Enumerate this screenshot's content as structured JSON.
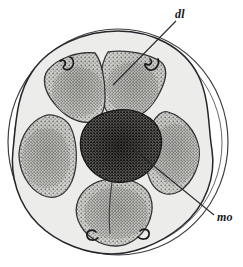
{
  "figure": {
    "kind": "anatomical-cross-section-line-drawing",
    "title": "",
    "background_color": "#ffffff",
    "ink_color": "#17171a",
    "outer_capsule": {
      "name": "outer-capsule-circle",
      "center": [
        118,
        142
      ],
      "radius_x": 110,
      "radius_y": 113,
      "stroke_color": "#3a3a3e",
      "fill_color": "#ffffff"
    },
    "inner_body": {
      "name": "inner-body-outline",
      "fill_color": "#e9e9e7",
      "stroke_color": "#2a2a2e"
    },
    "central_mass": {
      "name": "central-dark-mass",
      "label_ref": "mo",
      "fill_color": "#5c5a57",
      "stipple_color": "#1c1b1a",
      "stipple_density": "high"
    },
    "lobes": [
      {
        "id": 1,
        "name": "lobe-top-left",
        "angle_deg": -126,
        "stipple_density": "medium",
        "fill_color": "#cfcfcb"
      },
      {
        "id": 2,
        "name": "lobe-top-right",
        "angle_deg": -54,
        "stipple_density": "medium",
        "fill_color": "#cfcfcb"
      },
      {
        "id": 3,
        "name": "lobe-right",
        "angle_deg": 18,
        "stipple_density": "medium",
        "fill_color": "#cfcfcb"
      },
      {
        "id": 4,
        "name": "lobe-bottom-right",
        "angle_deg": 90,
        "stipple_density": "medium",
        "fill_color": "#cfcfcb"
      },
      {
        "id": 5,
        "name": "lobe-left",
        "angle_deg": 162,
        "stipple_density": "medium",
        "fill_color": "#cfcfcb"
      }
    ],
    "lobe_count": 5
  },
  "labels": [
    {
      "key": "dl",
      "text": "dl",
      "name": "label-dl",
      "style": "italic",
      "position": [
        175,
        8
      ],
      "leader_line": {
        "from": [
          176,
          20
        ],
        "to": [
          113,
          84
        ]
      }
    },
    {
      "key": "mo",
      "text": "mo",
      "name": "label-mo",
      "style": "italic",
      "position": [
        217,
        211
      ],
      "leader_line": {
        "from": [
          215,
          215
        ],
        "to": [
          133,
          148
        ]
      }
    }
  ]
}
